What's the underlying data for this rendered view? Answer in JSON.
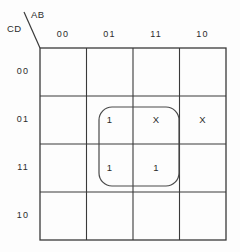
{
  "diagram": {
    "type": "karnaugh-map",
    "variables": 4,
    "axes": {
      "columns_label": "AB",
      "rows_label": "CD"
    },
    "column_headers": [
      "00",
      "01",
      "11",
      "10"
    ],
    "row_headers": [
      "00",
      "01",
      "11",
      "10"
    ],
    "cells": [
      [
        "",
        "",
        "",
        ""
      ],
      [
        "",
        "1",
        "X",
        "X"
      ],
      [
        "",
        "1",
        "1",
        ""
      ],
      [
        "",
        "",
        "",
        ""
      ]
    ],
    "groups": [
      {
        "name": "group-1",
        "columns": [
          "01",
          "11"
        ],
        "rows": [
          "01",
          "11"
        ],
        "x": 99,
        "y": 107,
        "width": 80,
        "height": 79,
        "radius": 13
      }
    ],
    "colors": {
      "background": "#fdfdfd",
      "grid_line": "#3a3a3a",
      "text": "#2b2b2b",
      "group_outline": "#4a4a4a"
    },
    "geometry": {
      "grid_left": 40,
      "grid_top": 48,
      "grid_right": 226,
      "grid_bottom": 240,
      "col_x": [
        40,
        86.5,
        133,
        179.5,
        226
      ],
      "row_y": [
        48,
        96,
        144,
        192,
        240
      ],
      "header_diagonal": {
        "x1": 24,
        "y1": 12,
        "x2": 40,
        "y2": 48
      }
    }
  }
}
